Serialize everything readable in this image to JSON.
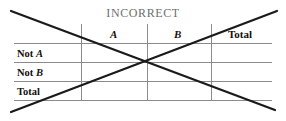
{
  "figure": {
    "title": "INCORRECT",
    "annotation": "large-x-strikeout",
    "colors": {
      "rule": "#8a8a8a",
      "text": "#15100c",
      "title": "#6e6e6e",
      "cross": "#1a1a1a",
      "background": "#ffffff"
    }
  },
  "table": {
    "corner_label": "",
    "column_headers": [
      {
        "label": "A",
        "style": "bold-italic"
      },
      {
        "label": "B",
        "style": "bold-italic"
      },
      {
        "label": "Total",
        "style": "bold"
      }
    ],
    "row_headers": [
      {
        "prefix": "Not",
        "variable": "A"
      },
      {
        "prefix": "Not",
        "variable": "B"
      },
      {
        "prefix": "Total",
        "variable": ""
      }
    ],
    "cells": [
      [
        "",
        "",
        ""
      ],
      [
        "",
        "",
        ""
      ],
      [
        "",
        "",
        ""
      ]
    ]
  }
}
